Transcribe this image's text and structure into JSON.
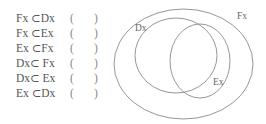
{
  "statements": [
    {
      "expr": "Fx ⊂Dx",
      "open": "(",
      "close": ")"
    },
    {
      "expr": "Fx ⊂Ex",
      "open": "(",
      "close": ")"
    },
    {
      "expr": "Ex ⊂Fx",
      "open": "(",
      "close": ")"
    },
    {
      "expr": "Dx⊂ Fx",
      "open": "(",
      "close": ")"
    },
    {
      "expr": "Dx⊂ Ex",
      "open": "(",
      "close": ")"
    },
    {
      "expr": "Ex ⊂Dx",
      "open": "(",
      "close": ")"
    }
  ],
  "diagram": {
    "labels": {
      "outer": "Fx",
      "left": "Dx",
      "right": "Ex"
    },
    "stroke_color": "#8a8a8a"
  }
}
